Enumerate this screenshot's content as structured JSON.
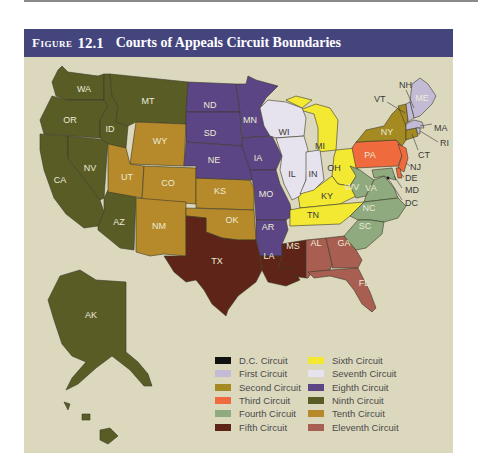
{
  "figure": {
    "label": "Figure",
    "number": "12.1",
    "title": "Courts of Appeals Circuit Boundaries"
  },
  "circuits": {
    "dc": {
      "name": "D.C. Circuit",
      "color": "#111111"
    },
    "first": {
      "name": "First Circuit",
      "color": "#c3bbd6"
    },
    "second": {
      "name": "Second Circuit",
      "color": "#a58a22"
    },
    "third": {
      "name": "Third Circuit",
      "color": "#ef6a3c"
    },
    "fourth": {
      "name": "Fourth Circuit",
      "color": "#8eaa7e"
    },
    "fifth": {
      "name": "Fifth Circuit",
      "color": "#5e2418"
    },
    "sixth": {
      "name": "Sixth Circuit",
      "color": "#f3e832"
    },
    "seventh": {
      "name": "Seventh Circuit",
      "color": "#e6e2ee"
    },
    "eighth": {
      "name": "Eighth Circuit",
      "color": "#5c4585"
    },
    "ninth": {
      "name": "Ninth Circuit",
      "color": "#5a5c26"
    },
    "tenth": {
      "name": "Tenth Circuit",
      "color": "#b68a2a"
    },
    "eleventh": {
      "name": "Eleventh Circuit",
      "color": "#a85e50"
    }
  },
  "legend": {
    "left": [
      "D.C. Circuit",
      "First Circuit",
      "Second Circuit",
      "Third Circuit",
      "Fourth Circuit",
      "Fifth Circuit"
    ],
    "right": [
      "Sixth Circuit",
      "Seventh Circuit",
      "Eighth Circuit",
      "Ninth Circuit",
      "Tenth Circuit",
      "Eleventh Circuit"
    ],
    "left_colors": [
      "#111111",
      "#c3bbd6",
      "#a58a22",
      "#ef6a3c",
      "#8eaa7e",
      "#5e2418"
    ],
    "right_colors": [
      "#f3e832",
      "#e6e2ee",
      "#5c4585",
      "#5a5c26",
      "#b68a2a",
      "#a85e50"
    ]
  },
  "states": {
    "WA": "WA",
    "OR": "OR",
    "CA": "CA",
    "NV": "NV",
    "ID": "ID",
    "MT": "MT",
    "AZ": "AZ",
    "AK": "AK",
    "WY": "WY",
    "UT": "UT",
    "CO": "CO",
    "NM": "NM",
    "KS": "KS",
    "OK": "OK",
    "ND": "ND",
    "SD": "SD",
    "NE": "NE",
    "MN": "MN",
    "IA": "IA",
    "MO": "MO",
    "AR": "AR",
    "WI": "WI",
    "IL": "IL",
    "IN": "IN",
    "MI": "MI",
    "OH": "OH",
    "KY": "KY",
    "TN": "TN",
    "TX": "TX",
    "LA": "LA",
    "MS": "MS",
    "AL": "AL",
    "GA": "GA",
    "FL": "FL",
    "WV": "WV",
    "VA": "VA",
    "NC": "NC",
    "SC": "SC",
    "MD": "MD",
    "PA": "PA",
    "NJ": "NJ",
    "DE": "DE",
    "NY": "NY",
    "VT": "VT",
    "CT": "CT",
    "ME": "ME",
    "NH": "NH",
    "MA": "MA",
    "RI": "RI",
    "DC": "DC"
  }
}
